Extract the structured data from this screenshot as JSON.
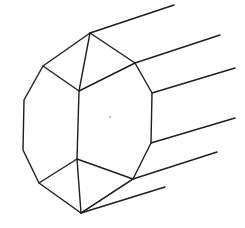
{
  "figure": {
    "stroke_color": "#1e1e1e",
    "background": "#ffffff",
    "vertices": {
      "top": [
        90,
        33
      ],
      "upper_left": [
        43,
        66
      ],
      "upper_inner": [
        79,
        91
      ],
      "upper_right": [
        135,
        63
      ],
      "right_top": [
        152,
        93
      ],
      "right_bottom": [
        151,
        143
      ],
      "lower_right": [
        133,
        179
      ],
      "lower_inner": [
        77,
        159
      ],
      "lower_left": [
        39,
        183
      ],
      "bottom": [
        81,
        213
      ],
      "left_top": [
        24,
        100
      ],
      "left_bottom": [
        23,
        150
      ]
    },
    "outline_path": "M90,33 L135,63 L152,93 L151,143 L133,179 L81,213 L39,183 L23,150 L24,100 L43,66 Z",
    "facet_lines": [
      "M43,66 L79,91 L135,63",
      "M90,33 L79,91",
      "M79,91 L77,159",
      "M39,183 L77,159 L133,179",
      "M77,159 L81,213",
      "M81,213 L133,179"
    ],
    "receding_edges": [
      "M90,33 L174,5",
      "M135,63 L220,35",
      "M152,93 L235,68",
      "M151,143 L235,118",
      "M133,179 L217,152",
      "M81,213 L165,187"
    ],
    "center_mark": [
      110,
      117
    ]
  }
}
